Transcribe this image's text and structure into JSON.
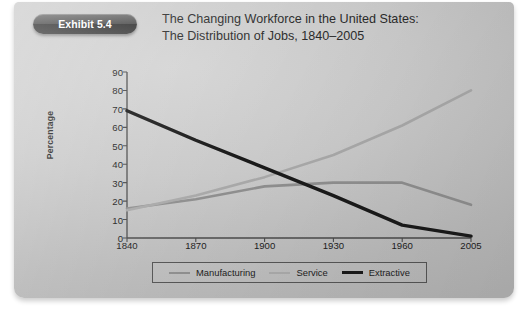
{
  "exhibit": {
    "badge_label": "Exhibit 5.4",
    "title_line_1": "The Changing Workforce in the United States:",
    "title_line_2": "The Distribution of Jobs, 1840–2005"
  },
  "colors": {
    "card_background": "#c9c9c9",
    "badge_background": "#3c3c3c",
    "badge_text": "#ffffff",
    "title_text": "#2b2b2b",
    "axis": "#4a4a4a",
    "manufacturing": "#8e8e8e",
    "service": "#a8a8a8",
    "extractive": "#1a1a1a",
    "legend_border": "#555555"
  },
  "chart_data": {
    "type": "line",
    "title": "The Changing Workforce in the United States: The Distribution of Jobs, 1840–2005",
    "xlabel": "",
    "ylabel": "Percentage",
    "ylim": [
      0,
      90
    ],
    "yticks": [
      0,
      10,
      20,
      30,
      40,
      50,
      60,
      70,
      80,
      90
    ],
    "xticks": [
      "1840",
      "1870",
      "1900",
      "1930",
      "1960",
      "2005"
    ],
    "x": [
      1840,
      1870,
      1900,
      1930,
      1960,
      2005
    ],
    "grid": false,
    "legend_position": "bottom",
    "series": [
      {
        "name": "Manufacturing",
        "color": "#8e8e8e",
        "values": [
          16,
          21,
          28,
          30,
          30,
          18
        ]
      },
      {
        "name": "Service",
        "color": "#a8a8a8",
        "values": [
          15,
          23,
          33,
          45,
          61,
          80
        ]
      },
      {
        "name": "Extractive",
        "color": "#1a1a1a",
        "values": [
          69,
          53,
          38,
          23,
          7,
          1
        ]
      }
    ]
  }
}
